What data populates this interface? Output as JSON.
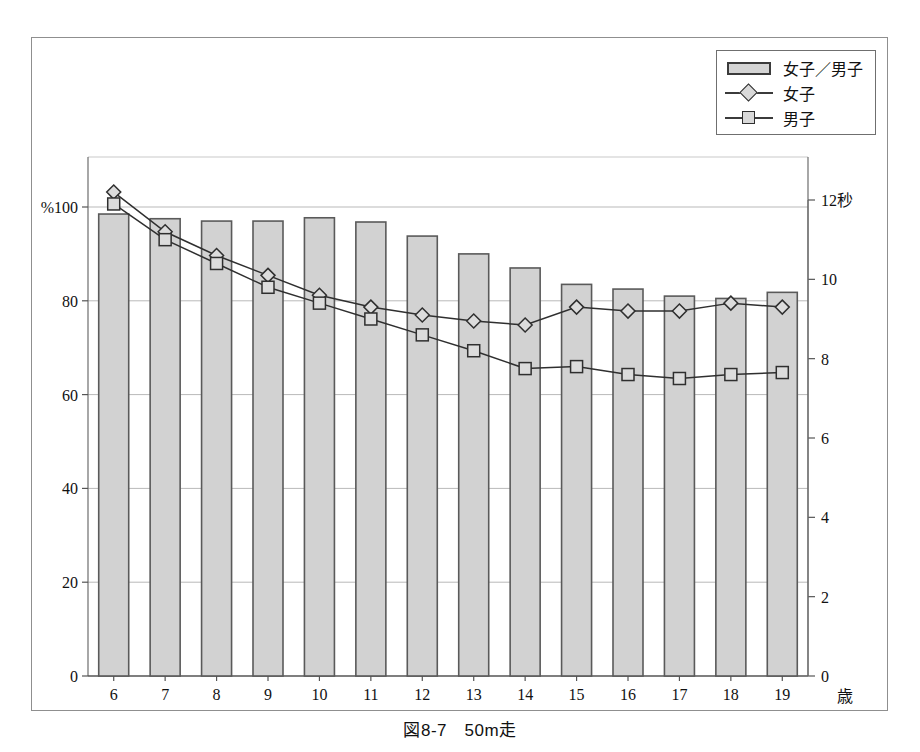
{
  "caption": "図8-7　50m走",
  "legend": {
    "position": "top-right",
    "items": [
      {
        "name": "bar-legend",
        "label": "女子／男子",
        "marker": "bar-swatch"
      },
      {
        "name": "girls-legend",
        "label": "女子",
        "marker": "line-diamond"
      },
      {
        "name": "boys-legend",
        "label": "男子",
        "marker": "line-square"
      }
    ]
  },
  "axes": {
    "left_unit": "%",
    "left_top_label": "%100",
    "left_ticks": [
      "100",
      "80",
      "60",
      "40",
      "20",
      "0"
    ],
    "right_unit": "秒",
    "right_top_label": "12秒",
    "right_ticks": [
      "12秒",
      "10",
      "8",
      "6",
      "4",
      "2",
      "0"
    ],
    "x_unit": "歳"
  },
  "chart_data": {
    "type": "bar",
    "title": "図8-7　50m走",
    "xlabel": "歳",
    "ylabel": "%",
    "y2label": "秒",
    "ylim": [
      0,
      100
    ],
    "y2lim": [
      0,
      12
    ],
    "grid": true,
    "legend_position": "top-right",
    "categories": [
      "6",
      "7",
      "8",
      "9",
      "10",
      "11",
      "12",
      "13",
      "14",
      "15",
      "16",
      "17",
      "18",
      "19"
    ],
    "series": [
      {
        "name": "女子／男子",
        "type": "bar",
        "axis": "left",
        "unit": "%",
        "values": [
          98.5,
          97.5,
          97.0,
          97.0,
          97.7,
          96.8,
          93.8,
          90.0,
          87.0,
          83.5,
          82.5,
          81.0,
          80.5,
          81.8
        ]
      },
      {
        "name": "女子",
        "type": "line",
        "axis": "right",
        "unit": "秒",
        "marker": "diamond",
        "values": [
          12.2,
          11.2,
          10.6,
          10.1,
          9.6,
          9.3,
          9.1,
          8.95,
          8.85,
          9.3,
          9.2,
          9.2,
          9.4,
          9.3
        ]
      },
      {
        "name": "男子",
        "type": "line",
        "axis": "right",
        "unit": "秒",
        "marker": "square",
        "values": [
          11.9,
          11.0,
          10.4,
          9.8,
          9.4,
          9.0,
          8.6,
          8.2,
          7.75,
          7.8,
          7.6,
          7.5,
          7.6,
          7.65
        ]
      }
    ]
  }
}
